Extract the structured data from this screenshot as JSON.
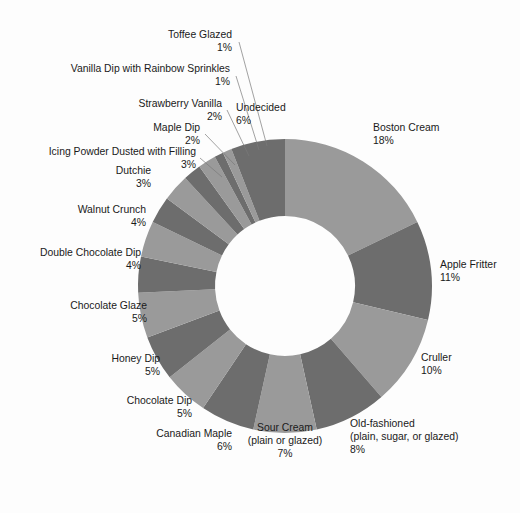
{
  "chart_data": {
    "type": "pie",
    "variant": "donut",
    "title": "",
    "subtitle": "",
    "xlabel": "",
    "ylabel": "",
    "legend_position": "none",
    "grid": false,
    "value_suffix": "%",
    "start_angle_deg": 0,
    "direction": "clockwise",
    "colors": {
      "light": "#9a9a9a",
      "dark": "#6d6d6d",
      "background": "#fdfdfd",
      "text": "#1a1a1a",
      "leader_line": "#7a7a7a",
      "hole": "#fdfdfd"
    },
    "categories": [
      "Boston Cream",
      "Apple Fritter",
      "Cruller",
      "Old-fashioned (plain, sugar, or glazed)",
      "Sour Cream (plain or glazed)",
      "Canadian Maple",
      "Chocolate Dip",
      "Honey Dip",
      "Chocolate Glaze",
      "Double Chocolate Dip",
      "Walnut Crunch",
      "Dutchie",
      "Icing Powder Dusted with Filling",
      "Maple Dip",
      "Strawberry Vanilla",
      "Vanilla Dip with Rainbow Sprinkles",
      "Toffee Glazed",
      "Undecided"
    ],
    "values": [
      18,
      11,
      10,
      8,
      7,
      6,
      5,
      5,
      5,
      4,
      4,
      3,
      3,
      2,
      2,
      1,
      1,
      6
    ],
    "slices": [
      {
        "label": "Boston Cream",
        "label_lines": [
          "Boston Cream"
        ],
        "value": 18,
        "value_text": "18%",
        "shade": "light"
      },
      {
        "label": "Apple Fritter",
        "label_lines": [
          "Apple Fritter"
        ],
        "value": 11,
        "value_text": "11%",
        "shade": "dark"
      },
      {
        "label": "Cruller",
        "label_lines": [
          "Cruller"
        ],
        "value": 10,
        "value_text": "10%",
        "shade": "light"
      },
      {
        "label": "Old-fashioned (plain, sugar, or glazed)",
        "label_lines": [
          "Old-fashioned",
          "(plain, sugar, or glazed)"
        ],
        "value": 8,
        "value_text": "8%",
        "shade": "dark"
      },
      {
        "label": "Sour Cream (plain or glazed)",
        "label_lines": [
          "Sour Cream",
          "(plain or glazed)"
        ],
        "value": 7,
        "value_text": "7%",
        "shade": "light"
      },
      {
        "label": "Canadian Maple",
        "label_lines": [
          "Canadian Maple"
        ],
        "value": 6,
        "value_text": "6%",
        "shade": "dark"
      },
      {
        "label": "Chocolate Dip",
        "label_lines": [
          "Chocolate Dip"
        ],
        "value": 5,
        "value_text": "5%",
        "shade": "light"
      },
      {
        "label": "Honey Dip",
        "label_lines": [
          "Honey Dip"
        ],
        "value": 5,
        "value_text": "5%",
        "shade": "dark"
      },
      {
        "label": "Chocolate Glaze",
        "label_lines": [
          "Chocolate Glaze"
        ],
        "value": 5,
        "value_text": "5%",
        "shade": "light"
      },
      {
        "label": "Double Chocolate Dip",
        "label_lines": [
          "Double Chocolate Dip"
        ],
        "value": 4,
        "value_text": "4%",
        "shade": "dark"
      },
      {
        "label": "Walnut Crunch",
        "label_lines": [
          "Walnut Crunch"
        ],
        "value": 4,
        "value_text": "4%",
        "shade": "light"
      },
      {
        "label": "Dutchie",
        "label_lines": [
          "Dutchie"
        ],
        "value": 3,
        "value_text": "3%",
        "shade": "dark"
      },
      {
        "label": "Icing Powder Dusted with Filling",
        "label_lines": [
          "Icing Powder Dusted with Filling"
        ],
        "value": 3,
        "value_text": "3%",
        "shade": "light"
      },
      {
        "label": "Maple Dip",
        "label_lines": [
          "Maple Dip"
        ],
        "value": 2,
        "value_text": "2%",
        "shade": "dark"
      },
      {
        "label": "Strawberry Vanilla",
        "label_lines": [
          "Strawberry Vanilla"
        ],
        "value": 2,
        "value_text": "2%",
        "shade": "light"
      },
      {
        "label": "Vanilla Dip with Rainbow Sprinkles",
        "label_lines": [
          "Vanilla Dip with Rainbow Sprinkles"
        ],
        "value": 1,
        "value_text": "1%",
        "shade": "dark"
      },
      {
        "label": "Toffee Glazed",
        "label_lines": [
          "Toffee Glazed"
        ],
        "value": 1,
        "value_text": "1%",
        "shade": "light"
      },
      {
        "label": "Undecided",
        "label_lines": [
          "Undecided"
        ],
        "value": 6,
        "value_text": "6%",
        "shade": "dark"
      }
    ],
    "geometry": {
      "cx": 285,
      "cy": 286,
      "outer_radius": 147,
      "inner_radius": 70
    },
    "label_placement": [
      {
        "label": "Boston Cream",
        "x": 373,
        "y": 131,
        "anchor": "start",
        "leader": false
      },
      {
        "label": "Apple Fritter",
        "x": 440,
        "y": 268,
        "anchor": "start",
        "leader": false
      },
      {
        "label": "Cruller",
        "x": 421,
        "y": 361,
        "anchor": "start",
        "leader": false
      },
      {
        "label": "Old-fashioned (plain, sugar, or glazed)",
        "x": 350,
        "y": 427,
        "anchor": "start",
        "leader": false
      },
      {
        "label": "Sour Cream (plain or glazed)",
        "x": 285,
        "y": 431,
        "anchor": "middle",
        "leader": false
      },
      {
        "label": "Canadian Maple",
        "x": 232,
        "y": 437,
        "anchor": "end",
        "leader": false
      },
      {
        "label": "Chocolate Dip",
        "x": 192,
        "y": 404,
        "anchor": "end",
        "leader": false
      },
      {
        "label": "Honey Dip",
        "x": 160,
        "y": 362,
        "anchor": "end",
        "leader": false
      },
      {
        "label": "Chocolate Glaze",
        "x": 147,
        "y": 309,
        "anchor": "end",
        "leader": false
      },
      {
        "label": "Double Chocolate Dip",
        "x": 141,
        "y": 256,
        "anchor": "end",
        "leader": false
      },
      {
        "label": "Walnut Crunch",
        "x": 146,
        "y": 213,
        "anchor": "end",
        "leader": false
      },
      {
        "label": "Dutchie",
        "x": 151,
        "y": 174,
        "anchor": "end",
        "leader": false
      },
      {
        "label": "Icing Powder Dusted with Filling",
        "x": 196,
        "y": 155,
        "anchor": "end",
        "leader": true,
        "lx1": 200,
        "ly1": 158,
        "lx2": 222,
        "ly2": 177
      },
      {
        "label": "Maple Dip",
        "x": 200,
        "y": 131,
        "anchor": "end",
        "leader": true,
        "lx1": 205,
        "ly1": 134,
        "lx2": 235,
        "ly2": 165
      },
      {
        "label": "Strawberry Vanilla",
        "x": 222,
        "y": 107,
        "anchor": "end",
        "leader": true,
        "lx1": 227,
        "ly1": 110,
        "lx2": 249,
        "ly2": 156
      },
      {
        "label": "Vanilla Dip with Rainbow Sprinkles",
        "x": 230,
        "y": 72,
        "anchor": "end",
        "leader": true,
        "lx1": 236,
        "ly1": 76,
        "lx2": 259,
        "ly2": 150
      },
      {
        "label": "Toffee Glazed",
        "x": 232,
        "y": 38,
        "anchor": "end",
        "leader": true,
        "lx1": 239,
        "ly1": 42,
        "lx2": 267,
        "ly2": 146
      },
      {
        "label": "Undecided",
        "x": 236,
        "y": 111,
        "anchor": "start",
        "leader": false
      }
    ]
  }
}
